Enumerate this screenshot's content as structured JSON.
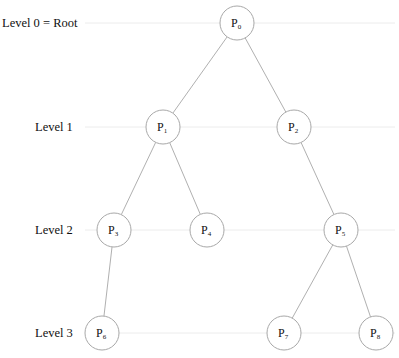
{
  "diagram": {
    "type": "tree",
    "colors": {
      "line": "#b0b0b0",
      "guide": "#ececec",
      "circle": "#a8a8a8",
      "text": "#111111"
    },
    "levels": [
      {
        "label": "Level 0 = Root",
        "y": 23,
        "label_x": 2,
        "line_x1": 85
      },
      {
        "label": "Level 1",
        "y": 127,
        "label_x": 35,
        "line_x1": 85
      },
      {
        "label": "Level 2",
        "y": 230,
        "label_x": 35,
        "line_x1": 85
      },
      {
        "label": "Level 3",
        "y": 333,
        "label_x": 35,
        "line_x1": 85
      }
    ],
    "guide_x2": 395,
    "node_radius": 17,
    "nodes": [
      {
        "id": "P0",
        "base": "P",
        "sub": "0",
        "x": 237,
        "y": 23
      },
      {
        "id": "P1",
        "base": "P",
        "sub": "1",
        "x": 163,
        "y": 127
      },
      {
        "id": "P2",
        "base": "P",
        "sub": "2",
        "x": 294,
        "y": 127
      },
      {
        "id": "P3",
        "base": "P",
        "sub": "3",
        "x": 114,
        "y": 230
      },
      {
        "id": "P4",
        "base": "P",
        "sub": "4",
        "x": 207,
        "y": 230
      },
      {
        "id": "P5",
        "base": "P",
        "sub": "5",
        "x": 341,
        "y": 230
      },
      {
        "id": "P6",
        "base": "P",
        "sub": "6",
        "x": 102,
        "y": 333
      },
      {
        "id": "P7",
        "base": "P",
        "sub": "7",
        "x": 284,
        "y": 333
      },
      {
        "id": "P8",
        "base": "P",
        "sub": "8",
        "x": 376,
        "y": 333
      }
    ],
    "edges": [
      [
        "P0",
        "P1"
      ],
      [
        "P0",
        "P2"
      ],
      [
        "P1",
        "P3"
      ],
      [
        "P1",
        "P4"
      ],
      [
        "P2",
        "P5"
      ],
      [
        "P3",
        "P6"
      ],
      [
        "P5",
        "P7"
      ],
      [
        "P5",
        "P8"
      ]
    ]
  }
}
